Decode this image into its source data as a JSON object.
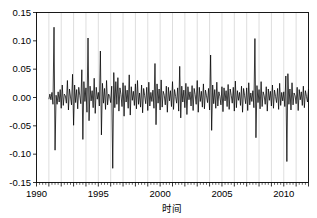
{
  "chart_data": {
    "type": "line",
    "title": "",
    "subtitle": "",
    "xlabel": "时间",
    "ylabel": "",
    "xlim": [
      1990.0,
      2012.0
    ],
    "ylim": [
      -0.15,
      0.15
    ],
    "grid": "vertical-yearly",
    "legend": "none",
    "line_color": "#000000",
    "grid_color": "#c8c8c8",
    "axis_color": "#000000",
    "background": "#ffffff",
    "yticks": [
      -0.15,
      -0.1,
      -0.05,
      0.0,
      0.05,
      0.1,
      0.15
    ],
    "ytick_labels": [
      "-0.15",
      "-0.10",
      "-0.05",
      "0.00",
      "0.05",
      "0.10",
      "0.15"
    ],
    "xticks": [
      1990,
      1995,
      2000,
      2005,
      2010
    ],
    "xtick_labels": [
      "1990",
      "1995",
      "2000",
      "2005",
      "2010"
    ],
    "x_minor_tick_interval": 0.25,
    "x_start": 1991.0,
    "x_step": 0.0833333,
    "series": [
      {
        "name": "series-1",
        "values": [
          -0.003,
          0.006,
          -0.004,
          0.009,
          -0.012,
          0.124,
          -0.093,
          0.004,
          -0.012,
          0.01,
          -0.008,
          0.014,
          -0.019,
          0.022,
          -0.014,
          0.006,
          0.003,
          -0.01,
          0.03,
          -0.022,
          0.015,
          0.001,
          -0.013,
          0.041,
          -0.049,
          0.022,
          -0.009,
          0.014,
          -0.02,
          0.018,
          0.004,
          -0.011,
          0.049,
          -0.074,
          0.028,
          -0.007,
          0.017,
          -0.026,
          0.105,
          -0.041,
          0.02,
          -0.006,
          0.012,
          -0.018,
          0.034,
          -0.028,
          0.018,
          -0.003,
          0.009,
          -0.015,
          0.082,
          -0.066,
          0.025,
          -0.01,
          0.016,
          -0.021,
          0.03,
          -0.013,
          0.006,
          0.002,
          -0.009,
          0.02,
          -0.125,
          0.044,
          -0.018,
          0.028,
          -0.012,
          0.035,
          -0.024,
          0.017,
          0.005,
          -0.016,
          0.026,
          -0.033,
          0.021,
          -0.008,
          0.013,
          -0.019,
          0.04,
          -0.031,
          0.019,
          -0.005,
          0.011,
          -0.014,
          0.024,
          -0.02,
          0.03,
          -0.012,
          0.008,
          -0.017,
          0.022,
          -0.027,
          0.016,
          0.003,
          -0.011,
          0.018,
          -0.023,
          0.027,
          -0.015,
          0.009,
          -0.007,
          0.013,
          -0.019,
          0.06,
          -0.048,
          0.024,
          -0.01,
          0.015,
          -0.022,
          0.031,
          -0.017,
          0.011,
          0.004,
          -0.013,
          0.02,
          -0.026,
          0.018,
          -0.006,
          0.012,
          -0.016,
          0.028,
          -0.021,
          0.014,
          0.002,
          -0.01,
          0.017,
          -0.024,
          0.055,
          -0.036,
          0.02,
          -0.008,
          0.013,
          -0.018,
          0.025,
          -0.03,
          0.019,
          -0.004,
          0.01,
          -0.015,
          0.021,
          -0.023,
          0.016,
          0.005,
          -0.012,
          0.03,
          -0.026,
          0.018,
          -0.007,
          0.011,
          -0.017,
          0.024,
          -0.02,
          0.013,
          0.003,
          -0.009,
          0.016,
          -0.022,
          0.075,
          -0.058,
          0.022,
          -0.011,
          0.014,
          -0.019,
          0.027,
          -0.015,
          0.01,
          0.002,
          -0.013,
          0.019,
          -0.025,
          0.017,
          -0.006,
          0.012,
          -0.016,
          0.023,
          -0.021,
          0.015,
          0.004,
          -0.01,
          0.018,
          -0.024,
          0.029,
          -0.018,
          0.012,
          -0.005,
          0.009,
          -0.014,
          0.02,
          -0.026,
          0.016,
          0.003,
          -0.011,
          0.017,
          -0.023,
          0.026,
          -0.013,
          0.008,
          -0.007,
          0.012,
          -0.018,
          0.104,
          -0.071,
          0.021,
          -0.009,
          0.014,
          -0.02,
          0.028,
          -0.016,
          0.01,
          0.003,
          -0.012,
          0.019,
          -0.024,
          0.015,
          -0.005,
          0.011,
          -0.015,
          0.022,
          -0.019,
          0.013,
          0.002,
          -0.009,
          0.016,
          -0.021,
          0.025,
          -0.014,
          0.009,
          -0.006,
          0.01,
          -0.016,
          0.038,
          -0.113,
          0.042,
          -0.012,
          0.015,
          -0.022,
          0.026,
          -0.013,
          0.008,
          0.003,
          -0.011,
          0.018,
          -0.023,
          0.014,
          -0.004,
          0.01,
          -0.014,
          0.02,
          -0.018,
          0.012,
          0.002,
          -0.008,
          0.015,
          -0.02,
          0.024,
          -0.013,
          0.008,
          -0.005,
          0.009,
          -0.015,
          0.028,
          -0.024,
          0.017,
          -0.007,
          0.012,
          -0.019,
          0.023,
          -0.012,
          0.007,
          0.002,
          -0.01,
          0.016,
          -0.021,
          0.013,
          -0.004,
          0.009,
          -0.013,
          0.019,
          -0.017,
          0.011,
          0.002,
          -0.008,
          0.014,
          -0.018,
          0.022,
          -0.012,
          0.007,
          -0.005,
          0.009,
          -0.014,
          0.026,
          -0.022,
          0.015,
          -0.006,
          0.011,
          -0.017,
          0.021,
          -0.011,
          0.007,
          0.002,
          -0.009,
          0.015,
          -0.042,
          0.024,
          -0.004,
          0.009,
          -0.013,
          0.018,
          -0.016,
          0.011,
          0.002,
          -0.008,
          0.013,
          -0.018,
          0.021,
          -0.011,
          0.007,
          -0.004,
          0.008,
          -0.013,
          0.024,
          -0.056,
          0.018,
          -0.006,
          0.01,
          -0.016,
          0.02,
          -0.011,
          0.006,
          0.002,
          -0.009,
          0.014,
          -0.019,
          0.012,
          -0.004,
          0.008,
          -0.012,
          0.017,
          -0.015,
          0.01,
          0.002,
          -0.007,
          0.012,
          -0.017,
          0.02,
          -0.01,
          0.006,
          -0.004,
          0.008,
          -0.012,
          0.022,
          -0.02,
          0.014,
          -0.006,
          0.01,
          -0.015,
          0.019,
          -0.01,
          0.006,
          0.002,
          -0.008,
          0.013,
          -0.017,
          0.011,
          -0.003,
          0.008,
          -0.012,
          0.016,
          -0.014,
          0.009,
          0.002,
          -0.007,
          0.012,
          -0.016,
          0.019,
          -0.01,
          0.006,
          -0.004,
          0.007,
          -0.012,
          0.096,
          -0.098,
          0.014,
          -0.005,
          0.01,
          -0.014,
          0.018,
          -0.01,
          0.006,
          0.002,
          -0.008,
          0.012,
          -0.016,
          0.011,
          -0.003,
          0.08,
          -0.07,
          0.016,
          -0.013,
          0.009,
          0.002,
          -0.007,
          0.011,
          -0.015,
          0.018,
          -0.009,
          0.006,
          -0.004,
          0.007,
          -0.011,
          0.02,
          -0.018,
          0.013,
          -0.005,
          0.009,
          -0.014,
          0.017,
          -0.009,
          0.005,
          0.002,
          -0.007
        ]
      }
    ]
  },
  "axes": {
    "x_axis_title": "时间"
  }
}
